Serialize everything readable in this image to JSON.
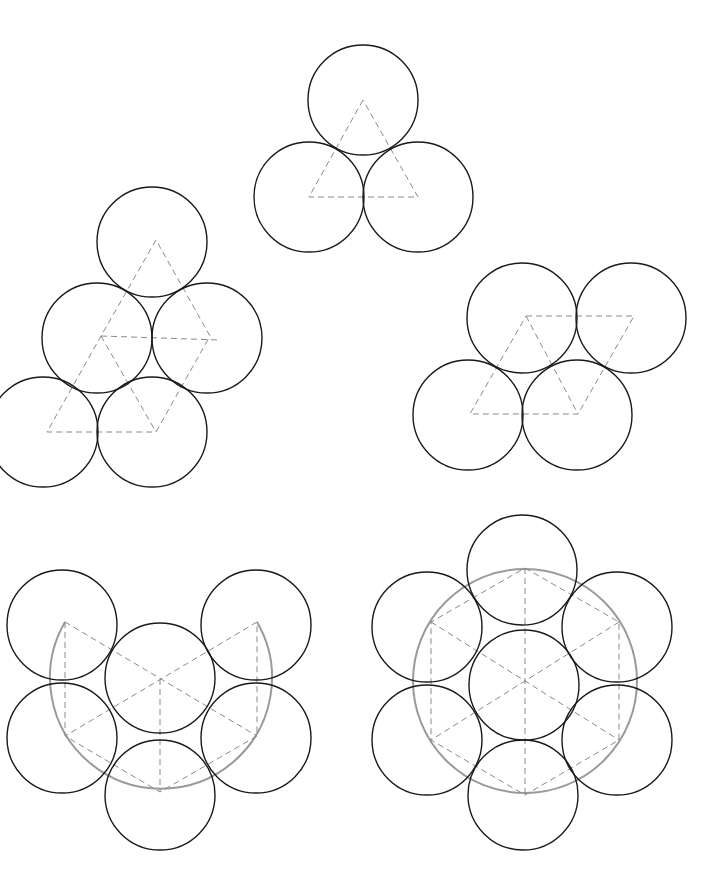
{
  "diagram": {
    "title": "",
    "colors": {
      "circle": "#1a1a1a",
      "dashed": "#8a8a8a",
      "guide": "#9a9a9a",
      "background": "#ffffff"
    },
    "radius": 55,
    "figures": [
      {
        "id": "three-circles",
        "circles": [
          [
            363,
            100
          ],
          [
            309,
            197
          ],
          [
            418,
            197
          ]
        ],
        "dashed_paths": [
          "M363,100 L309,197 L418,197 Z"
        ]
      },
      {
        "id": "five-circles-rhombus",
        "circles": [
          [
            152,
            242
          ],
          [
            97,
            338
          ],
          [
            207,
            338
          ],
          [
            43,
            432
          ],
          [
            152,
            432
          ]
        ],
        "dashed_paths": [
          "M156,240 L101,336 L47,432 L156,432 L210,336 Z",
          "M101,336 L220,340",
          "M101,336 L156,432"
        ]
      },
      {
        "id": "four-circles-parallelogram",
        "circles": [
          [
            522,
            318
          ],
          [
            631,
            318
          ],
          [
            468,
            415
          ],
          [
            577,
            415
          ]
        ],
        "dashed_paths": [
          "M526,316 L634,316 L578,414 L470,414 Z",
          "M526,316 L578,414"
        ]
      },
      {
        "id": "six-circles-open-hexagon",
        "circles": [
          [
            62,
            625
          ],
          [
            256,
            625
          ],
          [
            160,
            678
          ],
          [
            62,
            738
          ],
          [
            256,
            738
          ],
          [
            160,
            795
          ]
        ],
        "dashed_paths": [
          "M65,622 L65,736 L160,792 L257,736 L257,622",
          "M65,622 L257,736",
          "M257,622 L65,736",
          "M160,679 L160,792"
        ],
        "guide_arcs": [
          "M65,622 A111,111 0 1,0 257,622"
        ]
      },
      {
        "id": "seven-circles-hexagon",
        "circles": [
          [
            522,
            570
          ],
          [
            427,
            627
          ],
          [
            617,
            627
          ],
          [
            524,
            685
          ],
          [
            427,
            740
          ],
          [
            617,
            740
          ],
          [
            523,
            795
          ]
        ],
        "dashed_paths": [
          "M525,568 L619,622 L619,740 L525,795 L431,740 L431,622 Z",
          "M525,568 L525,795",
          "M431,622 L619,740",
          "M619,622 L431,740"
        ],
        "guide_circles": [
          [
            525,
            681,
            112
          ]
        ]
      }
    ]
  }
}
